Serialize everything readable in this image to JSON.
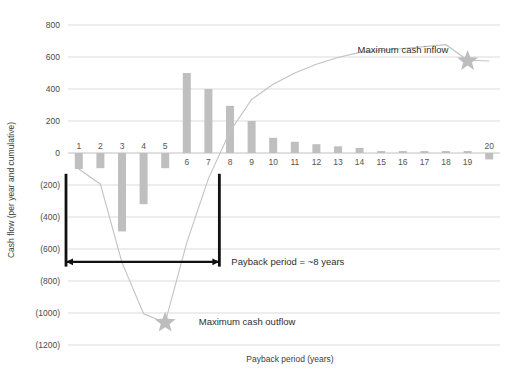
{
  "chart_data": {
    "type": "bar",
    "title": "",
    "xlabel": "Payback period (years)",
    "ylabel": "Cash flow (per year and cumulative)",
    "ylim": [
      -1200,
      800
    ],
    "ytick_values": [
      800,
      600,
      400,
      200,
      0,
      -200,
      -400,
      -600,
      -800,
      -1000,
      -1200
    ],
    "ytick_labels": [
      "800",
      "600",
      "400",
      "200",
      "0",
      "(200)",
      "(400)",
      "(600)",
      "(800)",
      "(1000)",
      "(1200)"
    ],
    "grid": true,
    "legend": "none",
    "categories": [
      "1",
      "2",
      "3",
      "4",
      "5",
      "6",
      "7",
      "8",
      "9",
      "10",
      "11",
      "12",
      "13",
      "14",
      "15",
      "16",
      "17",
      "18",
      "19",
      "20"
    ],
    "series": [
      {
        "name": "Cash flow per year",
        "type": "bar",
        "values": [
          -100,
          -95,
          -490,
          -320,
          -95,
          500,
          400,
          295,
          200,
          95,
          70,
          55,
          42,
          32,
          12,
          12,
          12,
          12,
          12,
          -40
        ]
      },
      {
        "name": "Cumulative cash flow",
        "type": "line",
        "values": [
          -100,
          -195,
          -685,
          -1005,
          -1060,
          -560,
          -160,
          135,
          335,
          430,
          500,
          555,
          597,
          629,
          641,
          653,
          665,
          677,
          580,
          575
        ]
      }
    ],
    "annotations": [
      {
        "name": "maximum-cash-inflow",
        "text": "Maximum cash inflow",
        "x": 19,
        "y": 575
      },
      {
        "name": "maximum-cash-outflow",
        "text": "Maximum cash outflow",
        "x": 5,
        "y": -1060
      },
      {
        "name": "payback-period",
        "text": "Payback period = ~8 years",
        "x_start": 0.5,
        "x_end": 7.6,
        "y": -680
      }
    ],
    "markers": [
      {
        "name": "max-inflow-star",
        "x": 19,
        "y": 575,
        "shape": "star"
      },
      {
        "name": "max-outflow-star",
        "x": 5,
        "y": -1060,
        "shape": "star"
      }
    ],
    "colors": {
      "bar": "#bfbfbf",
      "line": "#c2c2c2",
      "star": "#bdbdbd",
      "grid": "#d2d2d2",
      "marker": "#111111",
      "text": "#2e2e2e",
      "background": "#ffffff"
    }
  }
}
